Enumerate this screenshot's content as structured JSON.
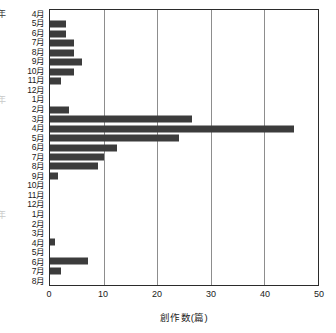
{
  "chart_data": {
    "type": "bar",
    "orientation": "horizontal",
    "title": "",
    "xlabel": "創作数(篇)",
    "ylabel": "",
    "xlim": [
      0,
      50
    ],
    "xticks": [
      0,
      10,
      20,
      30,
      40,
      50
    ],
    "grid": "vertical",
    "legend": "none",
    "bar_color": "#3c3c3c",
    "categories": [
      "4月",
      "5月",
      "6月",
      "7月",
      "8月",
      "9月",
      "10月",
      "11月",
      "12月",
      "1月",
      "2月",
      "3月",
      "4月",
      "5月",
      "6月",
      "7月",
      "8月",
      "9月",
      "10月",
      "11月",
      "12月",
      "1月",
      "2月",
      "3月",
      "4月",
      "5月",
      "6月",
      "7月",
      "8月"
    ],
    "values": [
      0,
      3,
      3,
      4.5,
      4.5,
      6,
      4.5,
      2,
      0,
      0,
      3.5,
      26.5,
      45.5,
      24,
      12.5,
      10,
      9,
      1.5,
      0,
      0,
      0,
      0,
      0,
      0,
      1,
      0,
      7,
      2,
      0
    ],
    "group_markers": [
      {
        "label": "年",
        "row_index": 0
      },
      {
        "label": "年",
        "row_index": 9
      },
      {
        "label": "年",
        "row_index": 21
      }
    ]
  }
}
